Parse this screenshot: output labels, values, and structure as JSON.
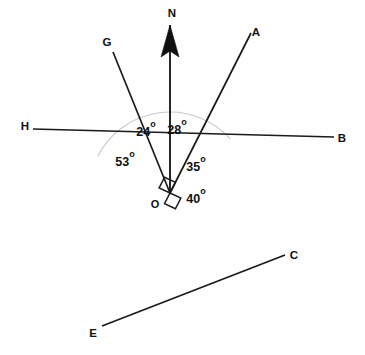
{
  "figure": {
    "type": "geometry-bearing-diagram",
    "background_color": "#fefefe",
    "line_color": "#1a1a1a",
    "arc_color": "#c9c9c9",
    "vertex": {
      "label": "O",
      "x": 170,
      "y": 193,
      "label_x": 155,
      "label_y": 208
    },
    "north": {
      "label": "N",
      "label_x": 172,
      "label_y": 17,
      "tail_x": 170,
      "tail_y": 193,
      "tip_x": 170,
      "tip_y": 25,
      "arrow_half_width": 9,
      "arrow_length": 32
    },
    "rays": [
      {
        "name": "ray-OG",
        "label": "G",
        "x2": 113,
        "y2": 52,
        "label_x": 107,
        "label_y": 46
      },
      {
        "name": "ray-OA",
        "label": "A",
        "x2": 251,
        "y2": 33,
        "label_x": 256,
        "label_y": 36
      },
      {
        "name": "ray-OB",
        "label": "B",
        "x2": 334,
        "y2": 137,
        "label_x": 342,
        "label_y": 142
      },
      {
        "name": "ray-OC",
        "label": "C",
        "x2": 285,
        "y2": 255,
        "label_x": 294,
        "label_y": 259
      },
      {
        "name": "ray-OE",
        "label": "E",
        "x2": 102,
        "y2": 326,
        "label_x": 93,
        "label_y": 337
      },
      {
        "name": "ray-OH",
        "label": "H",
        "x2": 33,
        "y2": 129,
        "label_x": 25,
        "label_y": 130
      }
    ],
    "angles": [
      {
        "name": "angle-24",
        "value": "24",
        "unit": "o",
        "text": "24o",
        "x": 146,
        "y": 136,
        "between": "G to N"
      },
      {
        "name": "angle-28",
        "value": "28",
        "unit": "o",
        "text": "28o",
        "x": 177,
        "y": 134,
        "between": "N to A"
      },
      {
        "name": "angle-35",
        "value": "35",
        "unit": "o",
        "text": "35o",
        "x": 196,
        "y": 171,
        "between": "A to B"
      },
      {
        "name": "angle-40",
        "value": "40",
        "unit": "o",
        "text": "40o",
        "x": 196,
        "y": 203,
        "between": "B to C"
      },
      {
        "name": "angle-53",
        "value": "53",
        "unit": "o",
        "text": "53o",
        "x": 125,
        "y": 166,
        "between": "H to G"
      }
    ],
    "guide_arc": {
      "name": "reference-arc",
      "center_x": 170,
      "center_y": 193,
      "radius": 81,
      "start_deg": 207,
      "end_deg": 318,
      "description": "light gray reference arc from ray OH around through N to ray OC"
    },
    "right_angle": {
      "name": "right-angle-marker",
      "description": "square marker at O showing HB perpendicular to OE",
      "size": 12
    }
  }
}
